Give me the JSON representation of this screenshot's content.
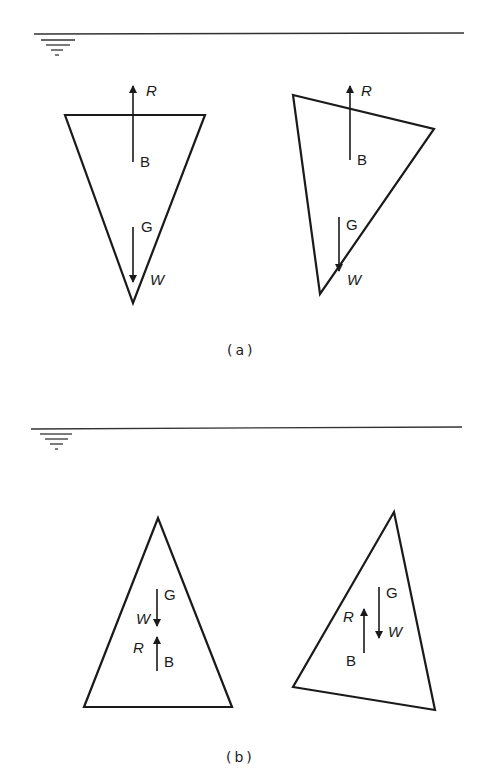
{
  "panels": [
    {
      "caption": "(a)",
      "description": "Inverted triangular bodies floating at surface; B above G",
      "left": {
        "R": "R",
        "B": "B",
        "G": "G",
        "W": "W"
      },
      "right": {
        "R": "R",
        "B": "B",
        "G": "G",
        "W": "W"
      }
    },
    {
      "caption": "(b)",
      "description": "Upright triangular bodies submerged; G above B",
      "left": {
        "R": "R",
        "B": "B",
        "G": "G",
        "W": "W"
      },
      "right": {
        "R": "R",
        "B": "B",
        "G": "G",
        "W": "W"
      }
    }
  ],
  "colors": {
    "ink": "#1a1a1a",
    "background": "#ffffff"
  }
}
